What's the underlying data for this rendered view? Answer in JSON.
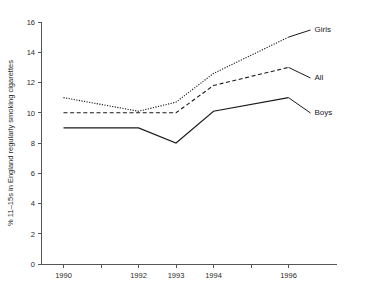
{
  "chart_data": {
    "type": "line",
    "title": "",
    "xlabel": "",
    "ylabel": "% 11–15s in England regularly smoking cigarettes",
    "x": [
      1990,
      1992,
      1993,
      1994,
      1996
    ],
    "xlim": [
      1989.4,
      1996.6
    ],
    "ylim": [
      0,
      16
    ],
    "x_tick_labels": [
      "1990",
      "1992",
      "1993",
      "1994",
      "1996"
    ],
    "x_minor_ticks": [
      1991,
      1995
    ],
    "y_ticks": [
      0,
      2,
      4,
      6,
      8,
      10,
      12,
      14,
      16
    ],
    "y_tick_labels": [
      "0",
      "2",
      "4",
      "6",
      "8",
      "10",
      "12",
      "14",
      "16"
    ],
    "grid": false,
    "legend_position": "right-inline",
    "series": [
      {
        "name": "Girls",
        "style": "dotted",
        "values": [
          11.0,
          10.1,
          10.7,
          12.6,
          15.0
        ]
      },
      {
        "name": "All",
        "style": "dashed",
        "values": [
          10.0,
          10.0,
          10.0,
          11.8,
          13.0
        ]
      },
      {
        "name": "Boys",
        "style": "solid",
        "values": [
          9.0,
          9.0,
          8.0,
          10.1,
          11.0
        ]
      }
    ]
  },
  "labels": {
    "y_axis_title": "% 11–15s in England regularly smoking cigarettes",
    "girls": "Girls",
    "all": "All",
    "boys": "Boys"
  }
}
